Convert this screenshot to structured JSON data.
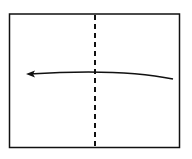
{
  "diagram": {
    "type": "origami-fold-instruction",
    "paper": {
      "x": 9,
      "y": 14,
      "width": 171,
      "height": 134,
      "stroke": "#111111"
    },
    "fold_line": {
      "style": "dashed",
      "orientation": "vertical",
      "x": 95,
      "y1": 15,
      "y2": 148
    },
    "arrow": {
      "direction": "left",
      "from": [
        173,
        79
      ],
      "to": [
        27,
        74
      ]
    },
    "colors": {
      "background": "#ffffff",
      "ink": "#111111"
    }
  }
}
